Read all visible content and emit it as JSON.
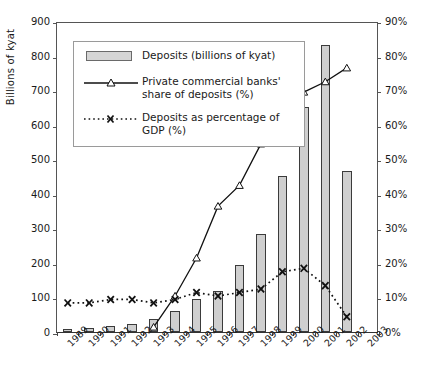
{
  "chart_data": {
    "type": "bar",
    "title": "",
    "categories": [
      "1989",
      "1990",
      "1991",
      "1992",
      "1993",
      "1994",
      "1995",
      "1996",
      "1997",
      "1998",
      "1999",
      "2000",
      "2001",
      "2002",
      "2003"
    ],
    "xlabel": "",
    "ylabel": "Billions of kyat",
    "ylim": [
      0,
      900
    ],
    "y_ticks": [
      "0",
      "100",
      "200",
      "300",
      "400",
      "500",
      "600",
      "700",
      "800",
      "900"
    ],
    "y2label": "",
    "y2lim": [
      0,
      90
    ],
    "y2_ticks": [
      "0%",
      "10%",
      "20%",
      "30%",
      "40%",
      "50%",
      "60%",
      "70%",
      "80%",
      "90%"
    ],
    "grid": false,
    "legend_position": "upper-left-inside",
    "series": [
      {
        "name": "Deposits (billions of kyat)",
        "type": "bar",
        "axis": "left",
        "color": "#cfcfcf",
        "edge_color": "#3b3b3b",
        "values": [
          8,
          13,
          18,
          22,
          38,
          62,
          95,
          120,
          195,
          285,
          452,
          650,
          830,
          466,
          null
        ]
      },
      {
        "name": "Private commercial banks' share of deposits (%)",
        "type": "line",
        "marker": "triangle",
        "axis": "right",
        "color": "#111111",
        "values": [
          null,
          null,
          null,
          null,
          2,
          11,
          22,
          37,
          43,
          55,
          63,
          70,
          73,
          77,
          null
        ]
      },
      {
        "name": "Deposits as percentage of GDP (%)",
        "type": "line",
        "marker": "x",
        "linestyle": "dotted",
        "axis": "right",
        "color": "#111111",
        "values": [
          9,
          9,
          10,
          10,
          9,
          10,
          12,
          11,
          12,
          13,
          18,
          19,
          14,
          5,
          null
        ]
      }
    ]
  },
  "axes": {
    "left_title": "Billions of kyat"
  },
  "legend": {
    "items": [
      {
        "key": "bar-swatch",
        "label": "Deposits (billions of kyat)"
      },
      {
        "key": "line-triangle",
        "label": "Private commercial banks' share of deposits (%)"
      },
      {
        "key": "line-x-dotted",
        "label": "Deposits as percentage of GDP (%)"
      }
    ]
  }
}
